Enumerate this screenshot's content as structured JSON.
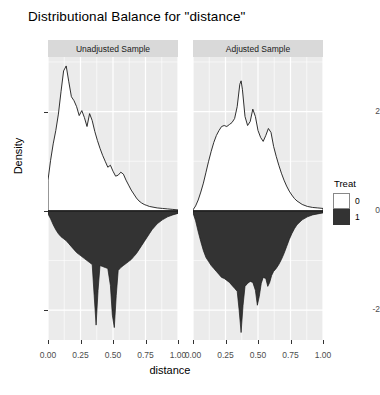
{
  "title": "Distributional Balance for \"distance\"",
  "axis": {
    "xlabel": "distance",
    "ylabel": "Density"
  },
  "legend": {
    "title": "Treat",
    "items": [
      {
        "label": "0",
        "color": "#ffffff"
      },
      {
        "label": "1",
        "color": "#333333"
      }
    ]
  },
  "panels": [
    {
      "strip": "Unadjusted Sample"
    },
    {
      "strip": "Adjusted Sample"
    }
  ],
  "ticks": {
    "y": [
      "2",
      "0",
      "-2"
    ],
    "x": [
      "0.00",
      "0.25",
      "0.50",
      "0.75",
      "1.00"
    ]
  },
  "chart_data": {
    "type": "area",
    "title": "Distributional Balance for \"distance\"",
    "xlabel": "distance",
    "ylabel": "Density",
    "xlim": [
      0.0,
      1.0
    ],
    "ylim": [
      -2.6,
      3.1
    ],
    "grid": true,
    "legend_position": "right",
    "legend_title": "Treat",
    "facets": [
      {
        "name": "Unadjusted Sample",
        "series": [
          {
            "name": "0",
            "treat": 0,
            "fill": "#ffffff",
            "direction": "up",
            "x": [
              0.0,
              0.02,
              0.04,
              0.06,
              0.08,
              0.1,
              0.12,
              0.14,
              0.16,
              0.18,
              0.2,
              0.22,
              0.24,
              0.26,
              0.28,
              0.3,
              0.32,
              0.34,
              0.36,
              0.38,
              0.4,
              0.42,
              0.44,
              0.46,
              0.48,
              0.5,
              0.52,
              0.54,
              0.56,
              0.58,
              0.6,
              0.62,
              0.64,
              0.66,
              0.68,
              0.7,
              0.72,
              0.74,
              0.76,
              0.78,
              0.8,
              0.84,
              0.88,
              0.92,
              0.96,
              1.0
            ],
            "y": [
              0.62,
              1.02,
              1.35,
              1.62,
              1.95,
              2.4,
              2.82,
              2.92,
              2.6,
              2.3,
              2.22,
              2.1,
              1.92,
              2.02,
              1.88,
              1.7,
              1.96,
              1.82,
              1.6,
              1.42,
              1.26,
              1.12,
              1.0,
              0.88,
              0.92,
              0.8,
              0.7,
              0.72,
              0.78,
              0.74,
              0.62,
              0.52,
              0.42,
              0.34,
              0.26,
              0.2,
              0.16,
              0.13,
              0.11,
              0.09,
              0.08,
              0.06,
              0.05,
              0.04,
              0.03,
              0.02
            ]
          },
          {
            "name": "1",
            "treat": 1,
            "fill": "#333333",
            "direction": "down",
            "x": [
              0.0,
              0.02,
              0.04,
              0.06,
              0.08,
              0.1,
              0.12,
              0.14,
              0.16,
              0.18,
              0.2,
              0.22,
              0.24,
              0.26,
              0.28,
              0.3,
              0.32,
              0.34,
              0.355,
              0.37,
              0.385,
              0.4,
              0.42,
              0.44,
              0.46,
              0.48,
              0.495,
              0.51,
              0.525,
              0.54,
              0.56,
              0.58,
              0.6,
              0.62,
              0.64,
              0.66,
              0.68,
              0.7,
              0.72,
              0.74,
              0.76,
              0.78,
              0.8,
              0.84,
              0.88,
              0.92,
              0.96,
              1.0
            ],
            "y": [
              0.06,
              0.16,
              0.28,
              0.38,
              0.46,
              0.52,
              0.56,
              0.6,
              0.66,
              0.72,
              0.78,
              0.84,
              0.88,
              0.92,
              0.96,
              1.0,
              1.04,
              1.08,
              1.7,
              2.3,
              1.6,
              1.1,
              1.12,
              1.14,
              1.16,
              1.5,
              2.1,
              2.35,
              1.7,
              1.2,
              1.14,
              1.1,
              1.06,
              1.02,
              0.98,
              0.92,
              0.86,
              0.78,
              0.7,
              0.62,
              0.54,
              0.46,
              0.38,
              0.26,
              0.18,
              0.12,
              0.08,
              0.05
            ]
          }
        ]
      },
      {
        "name": "Adjusted Sample",
        "series": [
          {
            "name": "0",
            "treat": 0,
            "fill": "#ffffff",
            "direction": "up",
            "x": [
              0.0,
              0.02,
              0.04,
              0.06,
              0.08,
              0.1,
              0.12,
              0.14,
              0.16,
              0.18,
              0.2,
              0.22,
              0.24,
              0.26,
              0.28,
              0.3,
              0.32,
              0.34,
              0.36,
              0.37,
              0.38,
              0.4,
              0.42,
              0.44,
              0.46,
              0.48,
              0.5,
              0.52,
              0.54,
              0.56,
              0.58,
              0.6,
              0.62,
              0.64,
              0.66,
              0.68,
              0.7,
              0.72,
              0.74,
              0.76,
              0.78,
              0.8,
              0.84,
              0.88,
              0.92,
              0.96,
              1.0
            ],
            "y": [
              0.02,
              0.1,
              0.22,
              0.38,
              0.56,
              0.78,
              1.0,
              1.2,
              1.38,
              1.52,
              1.62,
              1.7,
              1.72,
              1.7,
              1.74,
              1.78,
              1.86,
              2.1,
              2.55,
              2.62,
              2.45,
              1.9,
              1.72,
              1.8,
              2.05,
              1.9,
              1.62,
              1.48,
              1.4,
              1.52,
              1.66,
              1.58,
              1.3,
              1.1,
              0.92,
              0.76,
              0.62,
              0.5,
              0.4,
              0.32,
              0.25,
              0.2,
              0.13,
              0.09,
              0.07,
              0.06,
              0.05
            ]
          },
          {
            "name": "1",
            "treat": 1,
            "fill": "#333333",
            "direction": "down",
            "x": [
              0.0,
              0.02,
              0.04,
              0.06,
              0.08,
              0.1,
              0.12,
              0.14,
              0.16,
              0.18,
              0.2,
              0.22,
              0.24,
              0.26,
              0.28,
              0.3,
              0.32,
              0.34,
              0.355,
              0.37,
              0.385,
              0.4,
              0.42,
              0.44,
              0.46,
              0.48,
              0.495,
              0.51,
              0.525,
              0.54,
              0.56,
              0.575,
              0.59,
              0.605,
              0.62,
              0.64,
              0.66,
              0.68,
              0.7,
              0.72,
              0.74,
              0.76,
              0.78,
              0.8,
              0.84,
              0.88,
              0.92,
              0.96,
              1.0
            ],
            "y": [
              0.04,
              0.2,
              0.42,
              0.62,
              0.8,
              0.94,
              1.02,
              1.1,
              1.16,
              1.22,
              1.28,
              1.34,
              1.36,
              1.4,
              1.44,
              1.5,
              1.56,
              1.62,
              2.0,
              2.45,
              1.9,
              1.52,
              1.46,
              1.42,
              1.44,
              1.6,
              1.9,
              1.72,
              1.46,
              1.34,
              1.36,
              1.52,
              1.44,
              1.3,
              1.22,
              1.16,
              1.08,
              0.98,
              0.86,
              0.72,
              0.58,
              0.46,
              0.36,
              0.28,
              0.18,
              0.12,
              0.08,
              0.06,
              0.04
            ]
          }
        ]
      }
    ]
  }
}
